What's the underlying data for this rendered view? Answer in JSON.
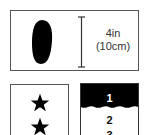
{
  "measurement": {
    "size_imperial": "4in",
    "size_metric": "(10cm)",
    "shape": "oval-icon"
  },
  "rating": {
    "stars_visible": 2,
    "icon": "star-icon"
  },
  "list": {
    "items": [
      "1",
      "2",
      "3"
    ],
    "highlighted_index": 0
  },
  "colors": {
    "ink": "#000000",
    "border": "#555555",
    "background": "#ffffff"
  }
}
